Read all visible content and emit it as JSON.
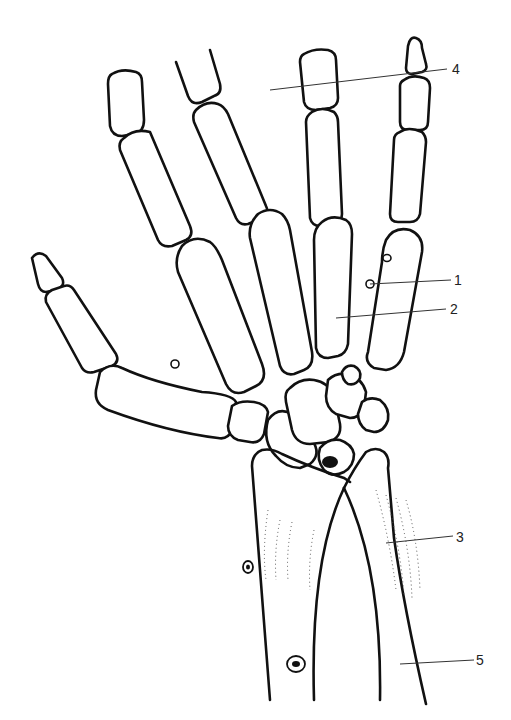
{
  "figure": {
    "line_color": "#111111",
    "background": "#ffffff"
  },
  "labels": [
    {
      "id": "1",
      "text": "1",
      "x": 454,
      "y": 273
    },
    {
      "id": "2",
      "text": "2",
      "x": 450,
      "y": 302
    },
    {
      "id": "3",
      "text": "3",
      "x": 456,
      "y": 530
    },
    {
      "id": "4",
      "text": "4",
      "x": 452,
      "y": 63
    },
    {
      "id": "5",
      "text": "5",
      "x": 476,
      "y": 653
    }
  ]
}
